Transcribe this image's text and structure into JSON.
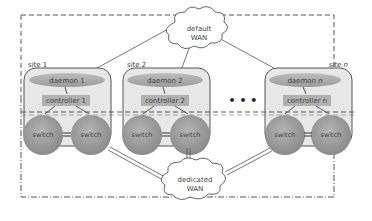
{
  "clouds": {
    "default_wan": {
      "line1": "default",
      "line2": "WAN"
    },
    "dedicated_wan": {
      "line1": "dedicated",
      "line2": "WAN"
    }
  },
  "sites": [
    {
      "label": "site 1",
      "daemon": "daemon 1",
      "controller": "controller 1",
      "switch_left": "switch",
      "switch_right": "switch"
    },
    {
      "label": "site 2",
      "daemon": "daemon 2",
      "controller": "controller 2",
      "switch_left": "switch",
      "switch_right": "switch"
    },
    {
      "label": "site n",
      "daemon": "daemon n",
      "controller": "controller n",
      "switch_left": "switch",
      "switch_right": "switch"
    }
  ],
  "ellipsis": "• • •",
  "colors": {
    "site_fill": "#e6e6e6",
    "daemon_fill": "#a8a8a8",
    "controller_fill": "#b0b0b0",
    "switch_fill": "#9a9a9a",
    "line": "#555555"
  }
}
